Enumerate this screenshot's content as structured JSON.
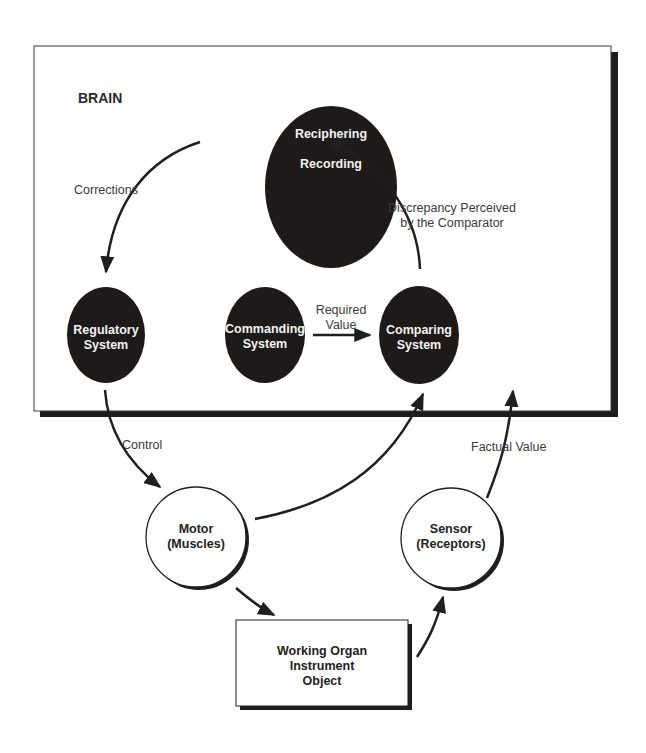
{
  "diagram": {
    "container": {
      "label": "BRAIN"
    },
    "nodes": {
      "recording": {
        "line1": "Reciphering",
        "line2": "Recording",
        "style": "dark"
      },
      "regulatory": {
        "line1": "Regulatory",
        "line2": "System",
        "style": "dark"
      },
      "commanding": {
        "line1": "Commanding",
        "line2": "System",
        "style": "dark"
      },
      "comparing": {
        "line1": "Comparing",
        "line2": "System",
        "style": "dark"
      },
      "motor": {
        "line1": "Motor",
        "line2": "(Muscles)",
        "style": "light"
      },
      "sensor": {
        "line1": "Sensor",
        "line2": "(Receptors)",
        "style": "light"
      },
      "working": {
        "line1": "Working Organ",
        "line2": "Instrument",
        "line3": "Object",
        "style": "box"
      }
    },
    "edges": {
      "corrections": {
        "label": "Corrections",
        "from": "recording",
        "to": "regulatory"
      },
      "discrepancy": {
        "line1": "Discrepancy Perceived",
        "line2": "by the Comparator",
        "from": "comparing",
        "to": "recording"
      },
      "required": {
        "line1": "Required",
        "line2": "Value",
        "from": "commanding",
        "to": "comparing"
      },
      "control": {
        "label": "Control",
        "from": "regulatory",
        "to": "motor"
      },
      "motor_to_comparing": {
        "from": "motor",
        "to": "comparing"
      },
      "factual": {
        "label": "Factual Value",
        "from": "sensor",
        "to": "comparing"
      },
      "motor_to_working": {
        "from": "motor",
        "to": "working"
      },
      "working_to_sensor": {
        "from": "working",
        "to": "sensor"
      }
    },
    "colors": {
      "node_fill": "#1e1a1a",
      "line": "#1f1f1f",
      "text_label": "#3a3a3a"
    }
  }
}
